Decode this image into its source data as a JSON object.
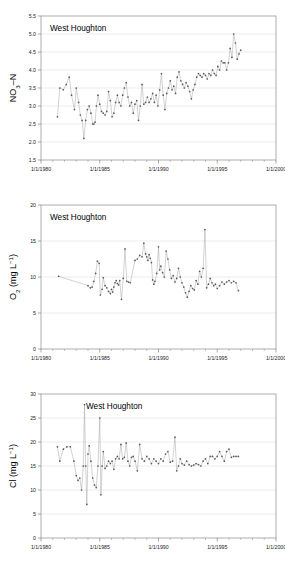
{
  "figure": {
    "site": "West Houghton",
    "colors": {
      "line": "#9a9a9a",
      "marker": "#595959",
      "grid": "#d9d9d9",
      "frame": "#8a8a8a",
      "text": "#1a1a1a"
    }
  },
  "chart_data": [
    {
      "type": "line",
      "title": "West Houghton",
      "xlabel": "",
      "ylabel": "NO3-N",
      "ylabel_parts": {
        "pre": "NO",
        "sub": "3",
        "post": "–N"
      },
      "xlim": [
        "1/1/1980",
        "1/1/2000"
      ],
      "ylim": [
        1.5,
        5.5
      ],
      "yticks": [
        "1.5",
        "2.0",
        "2.5",
        "3.0",
        "3.5",
        "4.0",
        "4.5",
        "5.0",
        "5.5"
      ],
      "xticks": [
        "1/1/1980",
        "1/1/1985",
        "1/1/1990",
        "1/1/1995",
        "1/1/2000"
      ],
      "grid": true,
      "legend": "none",
      "x": [
        1981.4,
        1981.6,
        1981.9,
        1982.15,
        1982.4,
        1982.6,
        1982.85,
        1983.0,
        1983.2,
        1983.35,
        1983.5,
        1983.65,
        1983.8,
        1983.95,
        1984.1,
        1984.25,
        1984.4,
        1984.5,
        1984.6,
        1984.72,
        1984.85,
        1985.0,
        1985.15,
        1985.3,
        1985.45,
        1985.6,
        1985.75,
        1985.9,
        1986.05,
        1986.2,
        1986.35,
        1986.5,
        1986.65,
        1986.8,
        1986.95,
        1987.1,
        1987.25,
        1987.4,
        1987.55,
        1987.7,
        1987.85,
        1988.0,
        1988.15,
        1988.3,
        1988.45,
        1988.6,
        1988.75,
        1988.9,
        1989.05,
        1989.2,
        1989.35,
        1989.5,
        1989.65,
        1989.8,
        1989.95,
        1990.1,
        1990.25,
        1990.4,
        1990.55,
        1990.7,
        1990.85,
        1991.0,
        1991.15,
        1991.3,
        1991.45,
        1991.6,
        1991.75,
        1991.9,
        1992.05,
        1992.2,
        1992.35,
        1992.5,
        1992.65,
        1992.8,
        1992.95,
        1993.1,
        1993.25,
        1993.4,
        1993.55,
        1993.7,
        1993.85,
        1994.0,
        1994.15,
        1994.3,
        1994.45,
        1994.6,
        1994.75,
        1994.9,
        1995.05,
        1995.2,
        1995.35,
        1995.5,
        1995.65,
        1995.8,
        1995.95,
        1996.1,
        1996.25,
        1996.4,
        1996.55,
        1996.7,
        1996.85,
        1997.0
      ],
      "values": [
        2.7,
        3.5,
        3.45,
        3.6,
        3.8,
        3.3,
        2.9,
        3.5,
        3.1,
        2.75,
        2.6,
        2.1,
        2.6,
        2.9,
        3.0,
        2.8,
        2.5,
        2.5,
        2.55,
        3.0,
        3.3,
        3.05,
        2.85,
        2.8,
        2.75,
        2.85,
        3.4,
        3.15,
        2.7,
        2.8,
        3.1,
        3.3,
        3.1,
        3.0,
        3.3,
        3.5,
        3.65,
        3.25,
        3.0,
        3.1,
        2.8,
        3.05,
        3.15,
        2.6,
        3.0,
        3.6,
        3.05,
        3.1,
        3.25,
        3.1,
        3.2,
        3.35,
        3.1,
        3.3,
        3.0,
        3.45,
        3.9,
        3.3,
        2.9,
        3.35,
        3.5,
        3.7,
        3.45,
        3.55,
        3.35,
        3.8,
        3.95,
        3.7,
        3.6,
        3.5,
        3.65,
        3.55,
        3.4,
        3.2,
        3.45,
        3.6,
        3.8,
        3.9,
        3.85,
        3.8,
        3.9,
        3.85,
        3.75,
        3.9,
        3.85,
        4.0,
        3.9,
        3.85,
        4.1,
        4.0,
        4.25,
        4.2,
        4.2,
        4.0,
        4.2,
        4.6,
        4.35,
        5.0,
        4.75,
        4.3,
        4.45,
        4.55,
        4.5
      ]
    },
    {
      "type": "line",
      "title": "West Houghton",
      "xlabel": "",
      "ylabel": "O2 (mg L-1)",
      "ylabel_parts": {
        "pre": "O",
        "sub": "2",
        "mid": " (mg L",
        "sup": "−1",
        "post": ")"
      },
      "xlim": [
        "1/1/1980",
        "1/1/2000"
      ],
      "ylim": [
        0,
        20
      ],
      "yticks": [
        "0",
        "5",
        "10",
        "15",
        "20"
      ],
      "xticks": [
        "1/1/1980",
        "1/1/1985",
        "1/1/1990",
        "1/1/1995",
        "1/1/2000"
      ],
      "grid": true,
      "legend": "none",
      "x": [
        1981.5,
        1984.0,
        1984.2,
        1984.35,
        1984.5,
        1984.65,
        1984.8,
        1984.95,
        1985.05,
        1985.2,
        1985.3,
        1985.45,
        1985.6,
        1985.75,
        1985.9,
        1986.0,
        1986.1,
        1986.2,
        1986.3,
        1986.4,
        1986.5,
        1986.6,
        1986.7,
        1986.85,
        1987.0,
        1987.15,
        1987.3,
        1987.45,
        1987.6,
        1988.0,
        1988.2,
        1988.4,
        1988.6,
        1988.75,
        1988.9,
        1989.0,
        1989.1,
        1989.2,
        1989.3,
        1989.4,
        1989.5,
        1989.6,
        1989.7,
        1989.85,
        1990.0,
        1990.1,
        1990.2,
        1990.35,
        1990.5,
        1990.65,
        1990.8,
        1990.95,
        1991.1,
        1991.25,
        1991.4,
        1991.55,
        1991.7,
        1991.85,
        1992.0,
        1992.15,
        1992.3,
        1992.45,
        1992.6,
        1992.75,
        1992.9,
        1993.05,
        1993.2,
        1993.35,
        1993.5,
        1993.65,
        1993.8,
        1993.95,
        1994.1,
        1994.25,
        1994.4,
        1994.55,
        1994.7,
        1994.85,
        1995.0,
        1995.2,
        1995.4,
        1995.6,
        1995.8,
        1996.0,
        1996.2,
        1996.4,
        1996.6,
        1996.8
      ],
      "values": [
        10.1,
        8.8,
        8.5,
        8.6,
        9.4,
        10.5,
        12.2,
        11.9,
        7.5,
        8.3,
        9.9,
        8.8,
        8.5,
        8.0,
        7.7,
        8.3,
        7.9,
        8.6,
        9.2,
        9.5,
        9.1,
        8.9,
        9.5,
        6.9,
        9.8,
        13.9,
        9.4,
        9.3,
        9.2,
        12.3,
        12.5,
        13.0,
        12.8,
        14.7,
        13.2,
        12.8,
        12.3,
        13.1,
        12.6,
        12.0,
        9.6,
        9.0,
        9.4,
        10.5,
        14.2,
        11.0,
        11.5,
        10.6,
        10.0,
        13.6,
        12.5,
        11.0,
        9.8,
        10.2,
        9.3,
        9.8,
        11.2,
        10.0,
        9.2,
        8.6,
        7.8,
        7.2,
        8.0,
        8.8,
        8.4,
        8.2,
        9.5,
        9.0,
        10.8,
        10.0,
        11.2,
        16.6,
        8.5,
        9.0,
        9.8,
        9.2,
        8.8,
        9.0,
        8.4,
        8.8,
        9.3,
        9.0,
        9.3,
        9.5,
        9.2,
        9.4,
        9.2,
        8.1
      ]
    },
    {
      "type": "line",
      "title": "West Houghton",
      "xlabel": "",
      "ylabel": "Cl (mg L-1)",
      "ylabel_parts": {
        "pre": "Cl (mg L",
        "sup": "−1",
        "post": ")"
      },
      "xlim": [
        "1/1/1980",
        "1/1/2000"
      ],
      "ylim": [
        0,
        30
      ],
      "yticks": [
        "0",
        "5",
        "10",
        "15",
        "20",
        "25",
        "30"
      ],
      "xticks": [
        "1/1/1980",
        "1/1/1985",
        "1/1/1990",
        "1/1/1995",
        "1/1/2000"
      ],
      "grid": true,
      "legend": "none",
      "x": [
        1981.4,
        1981.6,
        1981.9,
        1982.2,
        1982.5,
        1982.8,
        1983.0,
        1983.15,
        1983.3,
        1983.45,
        1983.6,
        1983.7,
        1983.8,
        1983.9,
        1984.0,
        1984.1,
        1984.25,
        1984.4,
        1984.55,
        1984.7,
        1984.85,
        1985.0,
        1985.1,
        1985.2,
        1985.3,
        1985.45,
        1985.6,
        1985.75,
        1985.9,
        1986.05,
        1986.2,
        1986.35,
        1986.5,
        1986.65,
        1986.8,
        1986.95,
        1987.1,
        1987.25,
        1987.4,
        1987.55,
        1987.7,
        1987.85,
        1988.0,
        1988.2,
        1988.4,
        1988.6,
        1988.8,
        1989.0,
        1989.2,
        1989.4,
        1989.6,
        1989.8,
        1990.0,
        1990.2,
        1990.4,
        1990.6,
        1990.8,
        1991.0,
        1991.2,
        1991.4,
        1991.55,
        1991.7,
        1991.85,
        1992.0,
        1992.2,
        1992.4,
        1992.6,
        1992.8,
        1993.0,
        1993.2,
        1993.4,
        1993.6,
        1993.8,
        1994.0,
        1994.2,
        1994.4,
        1994.6,
        1994.8,
        1995.0,
        1995.2,
        1995.4,
        1995.6,
        1995.8,
        1996.0,
        1996.2,
        1996.4,
        1996.6,
        1996.8
      ],
      "values": [
        19.0,
        16.0,
        18.5,
        19.0,
        19.0,
        16.0,
        13.0,
        12.0,
        12.5,
        10.0,
        15.0,
        27.8,
        15.0,
        7.0,
        17.5,
        19.2,
        16.0,
        12.5,
        11.0,
        10.5,
        15.0,
        25.0,
        9.0,
        15.0,
        18.0,
        14.5,
        15.0,
        16.0,
        15.5,
        16.0,
        14.3,
        16.5,
        17.0,
        16.5,
        19.5,
        16.5,
        16.8,
        19.8,
        16.0,
        15.0,
        16.8,
        17.0,
        16.0,
        14.0,
        19.5,
        16.5,
        16.0,
        17.0,
        16.5,
        15.5,
        16.5,
        16.0,
        15.5,
        16.5,
        16.0,
        17.5,
        18.0,
        15.8,
        16.0,
        21.0,
        14.0,
        15.0,
        16.5,
        15.5,
        15.2,
        16.0,
        15.3,
        15.0,
        15.2,
        15.5,
        15.3,
        15.0,
        16.0,
        16.5,
        15.5,
        17.0,
        17.0,
        16.5,
        17.0,
        18.0,
        17.0,
        16.0,
        18.0,
        18.5,
        16.8,
        17.0,
        17.0,
        17.0
      ]
    }
  ]
}
